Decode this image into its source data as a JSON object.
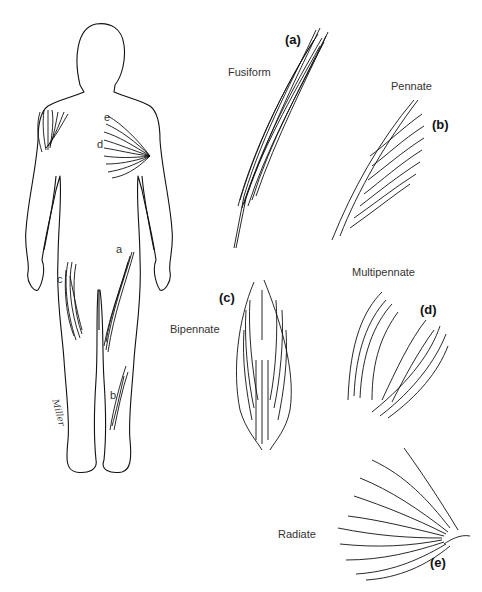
{
  "figure": {
    "type": "muscle fiber arrangement diagram",
    "body_figure": {
      "markers": [
        {
          "id": "a",
          "label": "a",
          "location": "front of right thigh"
        },
        {
          "id": "b",
          "label": "b",
          "location": "lower leg"
        },
        {
          "id": "c",
          "label": "c",
          "location": "left thigh"
        },
        {
          "id": "d",
          "label": "d",
          "location": "shoulder"
        },
        {
          "id": "e",
          "label": "e",
          "location": "chest"
        }
      ],
      "signature": "Miller"
    },
    "panels": [
      {
        "tag": "(a)",
        "name": "Fusiform"
      },
      {
        "tag": "(b)",
        "name": "Pennate"
      },
      {
        "tag": "(c)",
        "name": "Bipennate"
      },
      {
        "tag": "(d)",
        "name": "Multipennate"
      },
      {
        "tag": "(e)",
        "name": "Radiate"
      }
    ]
  },
  "colors": {
    "line": "#111111",
    "background": "#ffffff"
  }
}
